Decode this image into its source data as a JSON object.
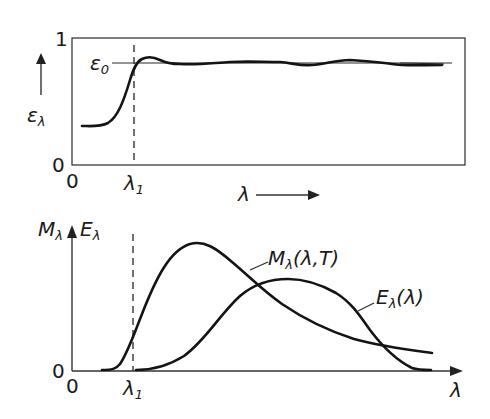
{
  "top_panel": {
    "y_axis_label": "ε",
    "y_axis_label_sub": "λ",
    "y_tick_top": "1",
    "y_tick_bottom": "0",
    "x_tick_origin": "0",
    "reference_label": "ε",
    "reference_label_sub": "0",
    "x_marker_label": "λ",
    "x_marker_label_sub": "1",
    "x_axis_label": "λ"
  },
  "bottom_panel": {
    "y_axis_label_left": "M",
    "y_axis_label_left_sub": "λ",
    "y_axis_label_right": "E",
    "y_axis_label_right_sub": "λ",
    "y_tick_origin": "0",
    "x_tick_origin": "0",
    "x_marker_label": "λ",
    "x_marker_label_sub": "1",
    "x_axis_label": "λ",
    "curve_m_label": "M",
    "curve_m_label_sub": "λ",
    "curve_m_label_args": "(λ,T)",
    "curve_e_label": "E",
    "curve_e_label_sub": "λ",
    "curve_e_label_args": "(λ)"
  },
  "colors": {
    "ink": "#141414",
    "background": "#ffffff"
  }
}
